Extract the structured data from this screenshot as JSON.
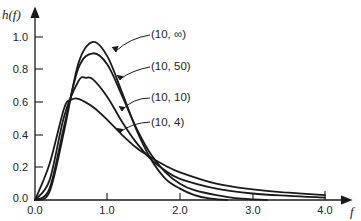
{
  "chart_data": {
    "type": "line",
    "title": "",
    "xlabel": "f",
    "ylabel": "h(f)",
    "xlim": [
      0,
      4.0
    ],
    "ylim": [
      0,
      1.0
    ],
    "grid": false,
    "legend_position": "inline labels with arrows, upper right of peaks",
    "x_ticks": [
      0.0,
      1.0,
      2.0,
      3.0,
      4.0
    ],
    "x_tick_labels": [
      "0.0",
      "1.0",
      "2.0",
      "3.0",
      "4.0"
    ],
    "y_ticks": [
      0.0,
      0.2,
      0.4,
      0.6,
      0.8,
      1.0
    ],
    "y_tick_labels": [
      "0.0",
      "0.2",
      "0.4",
      "0.6",
      "0.8",
      "1.0"
    ],
    "series": [
      {
        "name": "(10, ∞)",
        "x": [
          0.0,
          0.2,
          0.4,
          0.6,
          0.8,
          1.0,
          1.2,
          1.4,
          1.6,
          1.8,
          2.0,
          2.2,
          2.4,
          2.65
        ],
        "values": [
          0.0,
          0.05,
          0.42,
          0.84,
          0.97,
          0.88,
          0.66,
          0.43,
          0.25,
          0.13,
          0.07,
          0.03,
          0.01,
          0.0
        ]
      },
      {
        "name": "(10, 50)",
        "x": [
          0.0,
          0.2,
          0.4,
          0.6,
          0.8,
          1.0,
          1.2,
          1.4,
          1.6,
          1.8,
          2.0,
          2.2,
          2.5,
          2.8,
          3.2
        ],
        "values": [
          0.0,
          0.07,
          0.45,
          0.81,
          0.9,
          0.83,
          0.64,
          0.44,
          0.28,
          0.17,
          0.1,
          0.06,
          0.03,
          0.01,
          0.0
        ]
      },
      {
        "name": "(10, 10)",
        "x": [
          0.0,
          0.2,
          0.4,
          0.6,
          0.7,
          0.8,
          1.0,
          1.2,
          1.4,
          1.6,
          1.8,
          2.0,
          2.5,
          3.0,
          3.5,
          4.0
        ],
        "values": [
          0.0,
          0.12,
          0.51,
          0.73,
          0.75,
          0.74,
          0.63,
          0.48,
          0.35,
          0.25,
          0.18,
          0.13,
          0.07,
          0.04,
          0.025,
          0.015
        ]
      },
      {
        "name": "(10, 4)",
        "x": [
          0.0,
          0.2,
          0.4,
          0.5,
          0.6,
          0.8,
          1.0,
          1.2,
          1.4,
          1.6,
          1.8,
          2.0,
          2.5,
          3.0,
          3.5,
          4.0
        ],
        "values": [
          0.0,
          0.22,
          0.56,
          0.615,
          0.62,
          0.57,
          0.49,
          0.4,
          0.32,
          0.26,
          0.21,
          0.17,
          0.1,
          0.065,
          0.045,
          0.03
        ]
      }
    ],
    "annotations": [
      {
        "text": "(10, ∞)",
        "arrow_to": [
          0.95,
          0.92
        ]
      },
      {
        "text": "(10, 50)",
        "arrow_to": [
          1.05,
          0.75
        ]
      },
      {
        "text": "(10, 10)",
        "arrow_to": [
          1.15,
          0.52
        ]
      },
      {
        "text": "(10, 4)",
        "arrow_to": [
          1.15,
          0.42
        ]
      }
    ]
  },
  "labels": {
    "ylabel": "h(f)",
    "xlabel": "f",
    "x_ticks": [
      "0.0",
      "1.0",
      "2.0",
      "3.0",
      "4.0"
    ],
    "y_ticks": [
      "0.0",
      "0.2",
      "0.4",
      "0.6",
      "0.8",
      "1.0"
    ],
    "series": [
      "(10, ∞)",
      "(10, 50)",
      "(10, 10)",
      "(10, 4)"
    ]
  },
  "colors": {
    "ink": "#1a1a1a",
    "background": "#ffffff"
  }
}
